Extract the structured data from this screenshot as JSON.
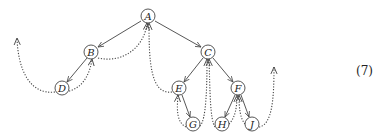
{
  "diagram": {
    "type": "binary tree traversal with threaded (dotted) return paths",
    "nodes": [
      {
        "id": "A",
        "label": "A",
        "x": 148,
        "y": 16
      },
      {
        "id": "B",
        "label": "B",
        "x": 91,
        "y": 52
      },
      {
        "id": "C",
        "label": "C",
        "x": 208,
        "y": 52
      },
      {
        "id": "D",
        "label": "D",
        "x": 62,
        "y": 88
      },
      {
        "id": "E",
        "label": "E",
        "x": 179,
        "y": 88
      },
      {
        "id": "F",
        "label": "F",
        "x": 238,
        "y": 88
      },
      {
        "id": "G",
        "label": "G",
        "x": 193,
        "y": 124
      },
      {
        "id": "H",
        "label": "H",
        "x": 222,
        "y": 124
      },
      {
        "id": "J",
        "label": "J",
        "x": 252,
        "y": 124
      }
    ],
    "edges": [
      {
        "from": "A",
        "to": "B"
      },
      {
        "from": "A",
        "to": "C"
      },
      {
        "from": "B",
        "to": "D"
      },
      {
        "from": "C",
        "to": "E"
      },
      {
        "from": "C",
        "to": "F"
      },
      {
        "from": "E",
        "to": "G"
      },
      {
        "from": "F",
        "to": "H"
      },
      {
        "from": "F",
        "to": "J"
      }
    ],
    "equation_number": "(7)"
  }
}
